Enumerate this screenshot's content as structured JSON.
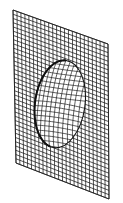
{
  "figure": {
    "colors": {
      "background": "#ffffff",
      "line": "#1a1a1a",
      "rim": "#111111",
      "dome_fill": "#ffffff"
    },
    "plane": {
      "corners": {
        "top_left": [
          13,
          10
        ],
        "top_right": [
          108,
          44
        ],
        "bottom_right": [
          109,
          199
        ],
        "bottom_left": [
          16,
          163
        ]
      },
      "columns": 24,
      "rows": 36
    },
    "dome": {
      "center": [
        60,
        104
      ],
      "rx": 25,
      "ry": 44,
      "rotation_deg": 8,
      "columns": 14,
      "rows": 22,
      "bulge": 0.55
    }
  }
}
